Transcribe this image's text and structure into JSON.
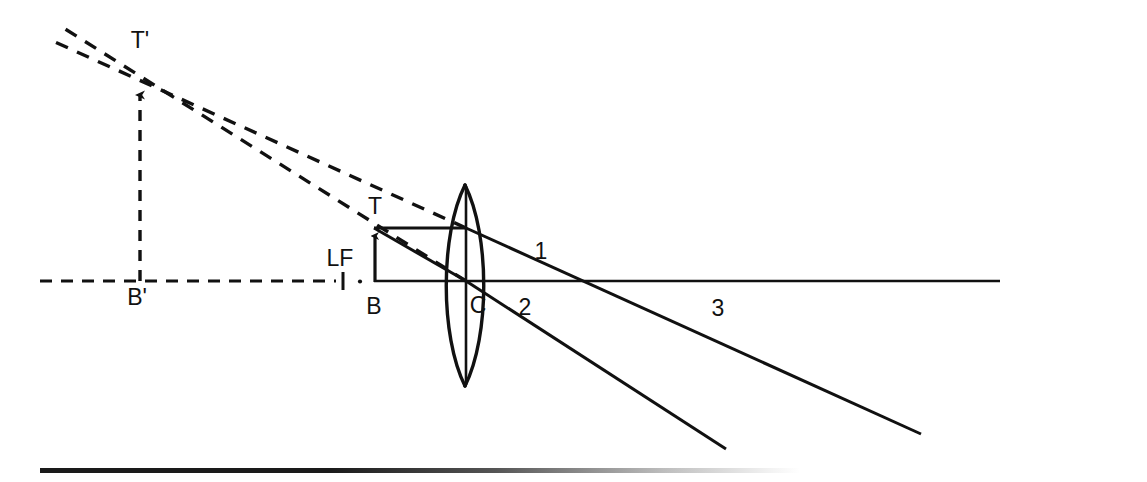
{
  "figure": {
    "type": "optics-ray-diagram",
    "background_color": "#ffffff",
    "stroke_color": "#111111",
    "width": 1147,
    "height": 482
  },
  "labels": {
    "image_tip": "T'",
    "image_base": "B'",
    "object_tip": "T",
    "object_base": "B",
    "lens_center": "C",
    "focal_length": "LF",
    "ray_one": "1",
    "ray_two": "2",
    "ray_three": "3"
  },
  "label_positions": {
    "image_tip": {
      "x": 140,
      "y": 42
    },
    "image_base": {
      "x": 137,
      "y": 297
    },
    "object_tip": {
      "x": 374,
      "y": 207
    },
    "object_base": {
      "x": 374,
      "y": 306
    },
    "lens_center": {
      "x": 478,
      "y": 306
    },
    "focal_length": {
      "x": 340,
      "y": 259
    },
    "ray_one": {
      "x": 541,
      "y": 252
    },
    "ray_two": {
      "x": 525,
      "y": 308
    },
    "ray_three": {
      "x": 718,
      "y": 309
    }
  },
  "geometry": {
    "optical_axis": {
      "dashed_segment": {
        "x1": 40,
        "y1": 281,
        "x2": 352,
        "y2": 281
      },
      "solid_segment": {
        "x1": 375,
        "y1": 281,
        "x2": 1000,
        "y2": 281
      },
      "focal_tick": {
        "x": 343,
        "y_top": 272,
        "y_bottom": 290
      },
      "focal_dot": {
        "x": 360,
        "y": 281
      }
    },
    "object_arrow": {
      "base": {
        "x": 375,
        "y": 281
      },
      "tip": {
        "x": 375,
        "y": 228
      },
      "height": 53
    },
    "image_arrow": {
      "base": {
        "x": 140,
        "y": 281
      },
      "tip": {
        "x": 140,
        "y": 86
      },
      "height": 195,
      "style": "dashed"
    },
    "lens": {
      "center_x": 466,
      "top_y": 185,
      "bottom_y": 386,
      "half_width": 22,
      "axis_line": {
        "x": 466,
        "y1": 185,
        "y2": 386
      }
    },
    "rays": [
      {
        "name": "ray-1-parallel",
        "label": "1",
        "incident": {
          "x1": 375,
          "y1": 228,
          "x2": 466,
          "y2": 228
        },
        "refracted": {
          "x1": 466,
          "y1": 228,
          "x2": 921,
          "y2": 434
        },
        "style": "solid"
      },
      {
        "name": "ray-2-through-center",
        "label": "2",
        "incident": {
          "x1": 375,
          "y1": 228,
          "x2": 466,
          "y2": 281
        },
        "refracted": {
          "x1": 466,
          "y1": 281,
          "x2": 726,
          "y2": 449
        },
        "style": "solid"
      },
      {
        "name": "ray-3-axis",
        "label": "3",
        "path": {
          "x1": 466,
          "y1": 281,
          "x2": 1000,
          "y2": 281
        },
        "style": "solid"
      }
    ],
    "virtual_extensions": [
      {
        "name": "virtual-ray-1",
        "from": {
          "x": 466,
          "y": 228
        },
        "to": {
          "x": 55,
          "y": 42
        },
        "style": "dashed"
      },
      {
        "name": "virtual-ray-2",
        "from": {
          "x": 466,
          "y": 281
        },
        "to": {
          "x": 62,
          "y": 28
        },
        "style": "dashed"
      }
    ],
    "construction_lines": {
      "object_to_axis_vertical": {
        "x": 375,
        "y1": 228,
        "y2": 281
      }
    },
    "bottom_bar": {
      "x": 40,
      "y": 468,
      "width": 760,
      "height": 5
    }
  }
}
